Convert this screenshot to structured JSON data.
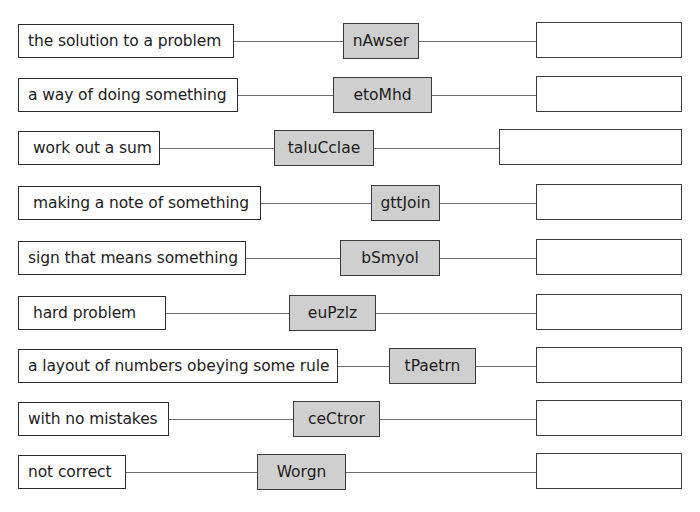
{
  "worksheet": {
    "rows": [
      {
        "clue": "the solution to a problem",
        "anagram": "nAwser",
        "answer": ""
      },
      {
        "clue": "a way of doing something",
        "anagram": "etoMhd",
        "answer": ""
      },
      {
        "clue": "work out a sum",
        "anagram": "taluCclae",
        "answer": ""
      },
      {
        "clue": "making a note of something",
        "anagram": "gttJoin",
        "answer": ""
      },
      {
        "clue": "sign that means something",
        "anagram": "bSmyol",
        "answer": ""
      },
      {
        "clue": "hard problem",
        "anagram": "euPzlz",
        "answer": ""
      },
      {
        "clue": "a layout of numbers obeying some rule",
        "anagram": "tPaetrn",
        "answer": ""
      },
      {
        "clue": "with no mistakes",
        "anagram": "ceCtror",
        "answer": ""
      },
      {
        "clue": "not correct",
        "anagram": "Worgn",
        "answer": ""
      }
    ],
    "colors": {
      "anagram_fill": "#cfcfcf",
      "border": "#2b2b2b",
      "connector": "#6e6e6e"
    }
  }
}
